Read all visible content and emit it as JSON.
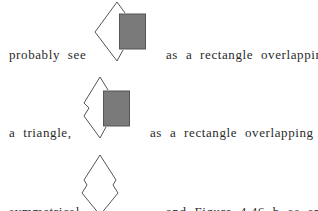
{
  "lines": [
    {
      "left": "probably see",
      "right": "as a rectangle overlapping"
    },
    {
      "left": "a triangle,",
      "right": "as a rectangle overlapping a"
    },
    {
      "left": "symmetrical",
      "right": "and Figure 4.46 b as an object"
    }
  ],
  "figures": [
    {
      "name": "figure-triangle-behind-rectangle",
      "rect_fill": "#7a7a7a"
    },
    {
      "name": "figure-zigzag-shape-behind-rectangle",
      "rect_fill": "#7a7a7a"
    },
    {
      "name": "figure-symmetrical-zigzag-shape"
    }
  ]
}
